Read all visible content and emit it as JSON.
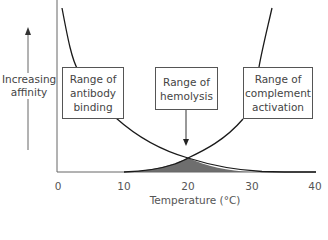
{
  "diagram": {
    "y_axis_label": "Increasing affinity",
    "y_axis_label_lines": [
      "Increasing",
      "affinity"
    ],
    "x_axis_label": "Temperature (°C)",
    "x_ticks": [
      "0",
      "10",
      "20",
      "30",
      "40"
    ],
    "boxes": [
      {
        "id": "antibody-binding",
        "lines": [
          "Range of",
          "antibody",
          "binding"
        ]
      },
      {
        "id": "hemolysis",
        "lines": [
          "Range of",
          "hemolysis"
        ]
      },
      {
        "id": "complement-activation",
        "lines": [
          "Range of",
          "complement",
          "activation"
        ]
      }
    ],
    "curves": [
      {
        "name": "antibody binding affinity",
        "trend": "decreasing with temperature"
      },
      {
        "name": "complement activation",
        "trend": "increasing with temperature"
      }
    ],
    "shaded_overlap": {
      "label": "Range of hemolysis",
      "center_temperature": 20,
      "range": [
        10,
        30
      ]
    },
    "colors": {
      "line": "#1a1a1a",
      "axis": "#555555",
      "shade": "#707070"
    }
  }
}
